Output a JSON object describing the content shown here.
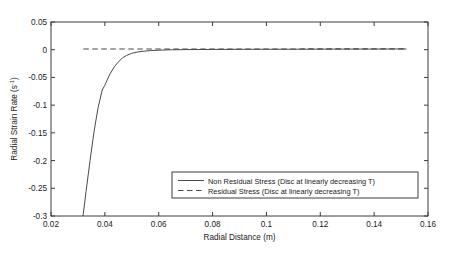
{
  "chart_data": {
    "type": "line",
    "title": "",
    "xlabel": "Radial Distance (m)",
    "ylabel": "Radial Strain Rate (s-1)",
    "ylabel_base": "Radial Strain Rate (s",
    "ylabel_sup": "-1",
    "ylabel_tail": ")",
    "xlim": [
      0.02,
      0.16
    ],
    "ylim": [
      -0.3,
      0.05
    ],
    "grid": false,
    "xticks": [
      0.02,
      0.04,
      0.06,
      0.08,
      0.1,
      0.12,
      0.14,
      0.16
    ],
    "xtick_labels": [
      "0.02",
      "0.04",
      "0.06",
      "0.08",
      "0.1",
      "0.12",
      "0.14",
      "0.16"
    ],
    "yticks": [
      0.05,
      0,
      -0.05,
      -0.1,
      -0.15,
      -0.2,
      -0.25,
      -0.3
    ],
    "ytick_labels": [
      "0.05",
      "0",
      "-0.05",
      "-0.1",
      "-0.15",
      "-0.2",
      "-0.25",
      "-0.3"
    ],
    "legend_position": "lower-right-inside",
    "series": [
      {
        "name": "Non Residual Stress (Disc at linearly decreasing T)",
        "style": "solid",
        "color": "#4a4a4a",
        "x": [
          0.0315,
          0.032,
          0.033,
          0.0345,
          0.036,
          0.0375,
          0.039,
          0.04,
          0.041,
          0.042,
          0.0435,
          0.045,
          0.0465,
          0.048,
          0.05,
          0.052,
          0.0545,
          0.057,
          0.06,
          0.065,
          0.07,
          0.08,
          0.09,
          0.1,
          0.11,
          0.12,
          0.13,
          0.14,
          0.148,
          0.152
        ],
        "y": [
          -0.31,
          -0.296,
          -0.256,
          -0.2,
          -0.147,
          -0.104,
          -0.073,
          -0.064,
          -0.053,
          -0.043,
          -0.031,
          -0.022,
          -0.015,
          -0.0105,
          -0.0065,
          -0.0042,
          -0.0026,
          -0.0016,
          -0.0008,
          -0.0001,
          0.0002,
          0.0005,
          0.0007,
          0.0008,
          0.0009,
          0.001,
          0.0011,
          0.0012,
          0.0013,
          0.0013
        ]
      },
      {
        "name": "Residual Stress (Disc at linearly decreasing T)",
        "style": "dashed",
        "color": "#4a4a4a",
        "x": [
          0.032,
          0.04,
          0.05,
          0.06,
          0.07,
          0.08,
          0.09,
          0.1,
          0.11,
          0.12,
          0.13,
          0.14,
          0.152
        ],
        "y": [
          0.0012,
          0.0012,
          0.0012,
          0.0013,
          0.0013,
          0.0013,
          0.0014,
          0.0014,
          0.0014,
          0.0015,
          0.0015,
          0.0015,
          0.0015
        ]
      }
    ],
    "legend_entries": [
      "Non Residual Stress (Disc at linearly decreasing T)",
      "Residual Stress (Disc at linearly decreasing T)"
    ]
  }
}
